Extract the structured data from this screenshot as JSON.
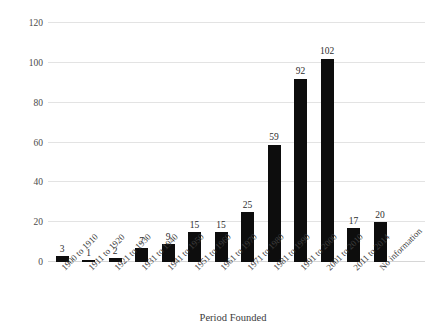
{
  "chart_data": {
    "type": "bar",
    "title": "",
    "xlabel": "Period Founded",
    "ylabel": "Number of Firms",
    "categories": [
      "1900 to 1910",
      "1911 to 1920",
      "1921 to 1930",
      "1931 to 1940",
      "1941 to 1950",
      "1951 to 1960",
      "1961 to 1970",
      "1971 to 1980",
      "1981 to 1990",
      "1991 to 2000",
      "2001 to 2010",
      "2011 to 2014",
      "No information"
    ],
    "values": [
      3,
      1,
      2,
      7,
      9,
      15,
      15,
      25,
      59,
      92,
      102,
      17,
      20
    ],
    "value_labels": [
      "3",
      "1",
      "2",
      "7",
      "9",
      "15",
      "15",
      "25",
      "59",
      "92",
      "102",
      "17",
      "20"
    ],
    "ylim": [
      0,
      120
    ],
    "yticks": [
      0,
      20,
      40,
      60,
      80,
      100,
      120
    ],
    "ytick_labels": [
      "0",
      "20",
      "40",
      "60",
      "80",
      "100",
      "120"
    ],
    "grid": true,
    "legend": false,
    "bar_color": "#0d0d0d",
    "grid_color": "#e3e3e3",
    "background": "#ffffff"
  }
}
